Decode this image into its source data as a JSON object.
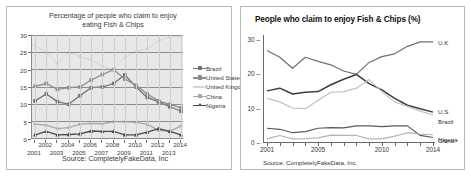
{
  "left_panel": {
    "title_line1": "Percentage of people who claim to enjoy",
    "title_line2": "eating Fish & Chips",
    "source": "Source: CompletelyFakeData, Inc",
    "y_ticks": [
      "0",
      "5",
      "10",
      "15",
      "20",
      "25",
      "30"
    ],
    "x_ticks": [
      "2001",
      "2002",
      "2003",
      "2004",
      "2005",
      "2006",
      "2007",
      "2008",
      "2009",
      "2010",
      "2011",
      "2012",
      "2013",
      "2014"
    ],
    "legend": [
      {
        "label": "Brazil",
        "color": "#7b6f73",
        "marker": "square"
      },
      {
        "label": "United States",
        "color": "#8d8d8d",
        "marker": "dash"
      },
      {
        "label": "United Kingdom",
        "color": "#d6d6d6",
        "marker": "line"
      },
      {
        "label": "China",
        "color": "#a8a8a8",
        "marker": "x"
      },
      {
        "label": "Nigeria",
        "color": "#4a4a4a",
        "marker": "triangle"
      }
    ]
  },
  "right_panel": {
    "title": "People who claim to enjoy Fish & Chips (%)",
    "source": "Source: CompletelyFakeData, Inc.",
    "y_ticks": [
      "0",
      "10",
      "20",
      "30"
    ],
    "x_ticks": [
      "2001",
      "2005",
      "2010",
      "2014"
    ],
    "series_labels": [
      {
        "label": "U.K",
        "color": "#6f6f6f"
      },
      {
        "label": "U.S",
        "color": "#3d3d3d"
      },
      {
        "label": "Brazil",
        "color": "#c2c2c2"
      },
      {
        "label": "China",
        "color": "#5a5a5a"
      },
      {
        "label": "Nigeria",
        "color": "#b5b5b5"
      }
    ]
  },
  "chart_data": [
    {
      "type": "line",
      "id": "left-chart",
      "title": "Percentage of people who claim to enjoy eating Fish & Chips",
      "xlabel": "",
      "ylabel": "",
      "ylim": [
        0,
        30
      ],
      "grid": true,
      "legend_position": "right",
      "x": [
        2001,
        2002,
        2003,
        2004,
        2005,
        2006,
        2007,
        2008,
        2009,
        2010,
        2011,
        2012,
        2013,
        2014
      ],
      "series": [
        {
          "name": "Brazil",
          "color": "#7b6f73",
          "values": [
            11.0,
            13.0,
            10.8,
            10.0,
            12.5,
            14.8,
            15.0,
            16.0,
            18.5,
            15.0,
            12.0,
            10.7,
            9.3,
            8.0
          ]
        },
        {
          "name": "United States",
          "color": "#8d8d8d",
          "values": [
            15.2,
            16.0,
            14.3,
            14.8,
            15.0,
            17.0,
            18.6,
            20.0,
            17.3,
            15.5,
            13.0,
            11.0,
            10.0,
            9.0
          ]
        },
        {
          "name": "United Kingdom",
          "color": "#d6d6d6",
          "values": [
            27.0,
            25.0,
            21.8,
            25.0,
            23.8,
            22.8,
            21.0,
            20.0,
            23.5,
            25.2,
            26.0,
            28.2,
            29.5,
            29.5
          ]
        },
        {
          "name": "China",
          "color": "#a8a8a8",
          "values": [
            4.3,
            4.0,
            3.0,
            3.3,
            4.3,
            4.5,
            4.4,
            5.0,
            5.0,
            4.8,
            4.2,
            2.5,
            2.2,
            3.8
          ]
        },
        {
          "name": "Nigeria",
          "color": "#4a4a4a",
          "values": [
            1.2,
            2.2,
            1.2,
            1.3,
            1.5,
            2.3,
            2.2,
            2.2,
            1.2,
            1.2,
            2.0,
            3.0,
            2.2,
            1.2
          ]
        }
      ]
    },
    {
      "type": "line",
      "id": "right-chart",
      "title": "People who claim to enjoy Fish & Chips (%)",
      "xlabel": "",
      "ylabel": "",
      "ylim": [
        0,
        30
      ],
      "grid": false,
      "legend_position": "right-inline",
      "x": [
        2001,
        2002,
        2003,
        2004,
        2005,
        2006,
        2007,
        2008,
        2009,
        2010,
        2011,
        2012,
        2013,
        2014
      ],
      "series": [
        {
          "name": "U.K",
          "color": "#6f6f6f",
          "values": [
            27.0,
            25.0,
            21.8,
            25.0,
            23.8,
            22.8,
            21.0,
            20.0,
            23.5,
            25.2,
            26.0,
            28.2,
            29.5,
            29.5
          ]
        },
        {
          "name": "U.S",
          "color": "#3d3d3d",
          "values": [
            15.2,
            16.0,
            14.3,
            14.8,
            15.0,
            17.0,
            18.6,
            20.0,
            17.3,
            15.5,
            13.0,
            11.0,
            10.0,
            9.0
          ]
        },
        {
          "name": "Brazil",
          "color": "#c2c2c2",
          "values": [
            13.0,
            12.0,
            10.2,
            10.0,
            12.5,
            14.8,
            15.0,
            16.0,
            18.5,
            15.0,
            12.0,
            10.7,
            9.3,
            8.2
          ]
        },
        {
          "name": "China",
          "color": "#5a5a5a",
          "values": [
            4.3,
            4.0,
            3.0,
            3.3,
            4.3,
            4.5,
            4.4,
            5.0,
            5.0,
            4.8,
            5.0,
            5.0,
            2.2,
            1.6
          ]
        },
        {
          "name": "Nigeria",
          "color": "#b5b5b5",
          "values": [
            1.2,
            2.2,
            1.2,
            1.3,
            1.5,
            2.3,
            2.2,
            2.2,
            1.2,
            1.2,
            2.0,
            3.0,
            2.6,
            2.4
          ]
        }
      ]
    }
  ]
}
